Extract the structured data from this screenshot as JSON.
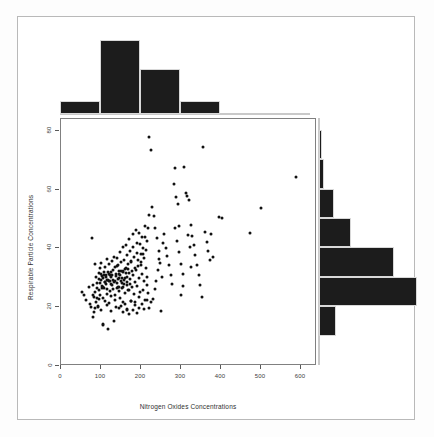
{
  "chart_data": {
    "type": "scatter",
    "title": "",
    "xlabel": "Nitrogen Oxides Concentrations",
    "ylabel": "Respirable Particle Concentrations",
    "xlim": [
      0,
      640
    ],
    "ylim": [
      0,
      84
    ],
    "xticks": [
      0,
      100,
      200,
      300,
      400,
      500,
      600
    ],
    "yticks": [
      0,
      20,
      40,
      60,
      80
    ],
    "grid": false,
    "legend": null,
    "marker_color": "#111111",
    "n_points": 260,
    "points": [
      [
        52,
        25.2
      ],
      [
        58,
        24.3
      ],
      [
        63,
        22.5
      ],
      [
        70,
        26.8
      ],
      [
        72,
        21.0
      ],
      [
        75,
        20.2
      ],
      [
        78,
        43.5
      ],
      [
        80,
        27.5
      ],
      [
        82,
        23.4
      ],
      [
        84,
        19.8
      ],
      [
        86,
        25.0
      ],
      [
        88,
        21.6
      ],
      [
        90,
        28.2
      ],
      [
        92,
        20.4
      ],
      [
        94,
        22.8
      ],
      [
        96,
        26.0
      ],
      [
        98,
        24.0
      ],
      [
        100,
        19.0
      ],
      [
        102,
        30.5
      ],
      [
        104,
        23.1
      ],
      [
        105,
        13.9
      ],
      [
        106,
        14.2
      ],
      [
        108,
        26.4
      ],
      [
        110,
        22.0
      ],
      [
        112,
        27.8
      ],
      [
        114,
        20.8
      ],
      [
        116,
        24.6
      ],
      [
        118,
        29.3
      ],
      [
        120,
        21.4
      ],
      [
        122,
        25.6
      ],
      [
        124,
        23.8
      ],
      [
        126,
        18.6
      ],
      [
        128,
        31.0
      ],
      [
        130,
        26.2
      ],
      [
        132,
        28.6
      ],
      [
        134,
        22.4
      ],
      [
        136,
        24.2
      ],
      [
        138,
        20.0
      ],
      [
        140,
        34.0
      ],
      [
        142,
        27.0
      ],
      [
        144,
        30.0
      ],
      [
        146,
        25.4
      ],
      [
        148,
        23.0
      ],
      [
        150,
        29.0
      ],
      [
        152,
        26.6
      ],
      [
        154,
        32.2
      ],
      [
        156,
        21.8
      ],
      [
        158,
        28.0
      ],
      [
        118,
        12.6
      ],
      [
        132,
        15.4
      ],
      [
        160,
        24.8
      ],
      [
        162,
        31.6
      ],
      [
        164,
        27.4
      ],
      [
        166,
        19.4
      ],
      [
        168,
        33.0
      ],
      [
        170,
        25.8
      ],
      [
        172,
        29.6
      ],
      [
        174,
        22.2
      ],
      [
        176,
        35.5
      ],
      [
        178,
        26.8
      ],
      [
        180,
        30.8
      ],
      [
        182,
        24.4
      ],
      [
        184,
        28.4
      ],
      [
        186,
        20.6
      ],
      [
        188,
        32.6
      ],
      [
        190,
        27.2
      ],
      [
        192,
        36.0
      ],
      [
        194,
        23.6
      ],
      [
        196,
        29.8
      ],
      [
        198,
        25.0
      ],
      [
        200,
        34.4
      ],
      [
        202,
        31.2
      ],
      [
        204,
        26.0
      ],
      [
        206,
        38.0
      ],
      [
        208,
        28.8
      ],
      [
        210,
        22.6
      ],
      [
        212,
        33.4
      ],
      [
        214,
        30.2
      ],
      [
        216,
        27.6
      ],
      [
        218,
        24.8
      ],
      [
        95,
        31.5
      ],
      [
        97,
        33.2
      ],
      [
        99,
        29.4
      ],
      [
        101,
        35.0
      ],
      [
        103,
        27.2
      ],
      [
        107,
        31.8
      ],
      [
        109,
        28.4
      ],
      [
        111,
        33.8
      ],
      [
        113,
        30.4
      ],
      [
        115,
        36.5
      ],
      [
        117,
        32.0
      ],
      [
        119,
        29.0
      ],
      [
        121,
        34.6
      ],
      [
        123,
        31.0
      ],
      [
        125,
        27.8
      ],
      [
        127,
        35.8
      ],
      [
        129,
        32.8
      ],
      [
        131,
        29.2
      ],
      [
        133,
        37.2
      ],
      [
        135,
        33.6
      ],
      [
        137,
        30.6
      ],
      [
        139,
        28.2
      ],
      [
        141,
        36.8
      ],
      [
        143,
        34.2
      ],
      [
        145,
        31.4
      ],
      [
        147,
        38.6
      ],
      [
        149,
        35.2
      ],
      [
        151,
        32.4
      ],
      [
        153,
        29.8
      ],
      [
        155,
        40.4
      ],
      [
        157,
        36.2
      ],
      [
        159,
        33.0
      ],
      [
        161,
        30.0
      ],
      [
        163,
        41.0
      ],
      [
        165,
        37.6
      ],
      [
        167,
        34.8
      ],
      [
        169,
        31.6
      ],
      [
        171,
        43.2
      ],
      [
        173,
        39.0
      ],
      [
        175,
        35.6
      ],
      [
        177,
        32.2
      ],
      [
        179,
        44.8
      ],
      [
        181,
        40.6
      ],
      [
        183,
        37.0
      ],
      [
        185,
        33.4
      ],
      [
        187,
        46.2
      ],
      [
        189,
        42.0
      ],
      [
        191,
        38.4
      ],
      [
        193,
        34.0
      ],
      [
        195,
        45.4
      ],
      [
        197,
        41.4
      ],
      [
        199,
        38.0
      ],
      [
        201,
        35.4
      ],
      [
        203,
        43.8
      ],
      [
        205,
        40.0
      ],
      [
        207,
        36.6
      ],
      [
        209,
        47.5
      ],
      [
        211,
        44.0
      ],
      [
        213,
        39.6
      ],
      [
        215,
        42.6
      ],
      [
        217,
        46.8
      ],
      [
        219,
        51.5
      ],
      [
        221,
        78.0
      ],
      [
        224,
        73.5
      ],
      [
        228,
        54.2
      ],
      [
        232,
        51.0
      ],
      [
        236,
        47.0
      ],
      [
        240,
        43.4
      ],
      [
        244,
        39.2
      ],
      [
        248,
        35.0
      ],
      [
        252,
        30.4
      ],
      [
        250,
        18.8
      ],
      [
        230,
        22.8
      ],
      [
        235,
        26.2
      ],
      [
        238,
        29.0
      ],
      [
        242,
        32.8
      ],
      [
        246,
        36.4
      ],
      [
        254,
        42.0
      ],
      [
        258,
        45.0
      ],
      [
        262,
        40.2
      ],
      [
        266,
        37.4
      ],
      [
        270,
        34.2
      ],
      [
        274,
        30.8
      ],
      [
        278,
        28.0
      ],
      [
        282,
        62.0
      ],
      [
        286,
        67.4
      ],
      [
        288,
        57.4
      ],
      [
        292,
        55.0
      ],
      [
        296,
        38.6
      ],
      [
        300,
        34.6
      ],
      [
        304,
        31.2
      ],
      [
        308,
        67.6
      ],
      [
        312,
        59.0
      ],
      [
        316,
        57.8
      ],
      [
        320,
        56.6
      ],
      [
        324,
        48.0
      ],
      [
        328,
        44.2
      ],
      [
        332,
        41.0
      ],
      [
        336,
        37.8
      ],
      [
        340,
        34.4
      ],
      [
        344,
        31.0
      ],
      [
        348,
        27.6
      ],
      [
        352,
        23.4
      ],
      [
        356,
        74.5
      ],
      [
        360,
        45.6
      ],
      [
        364,
        42.2
      ],
      [
        368,
        39.0
      ],
      [
        372,
        36.0
      ],
      [
        376,
        44.8
      ],
      [
        380,
        37.2
      ],
      [
        396,
        50.6
      ],
      [
        402,
        50.4
      ],
      [
        472,
        45.2
      ],
      [
        500,
        53.8
      ],
      [
        588,
        64.4
      ],
      [
        85,
        34.6
      ],
      [
        87,
        30.2
      ],
      [
        89,
        26.6
      ],
      [
        91,
        23.2
      ],
      [
        93,
        20.2
      ],
      [
        83,
        18.4
      ],
      [
        81,
        16.8
      ],
      [
        79,
        24.0
      ],
      [
        145,
        19.6
      ],
      [
        150,
        20.4
      ],
      [
        155,
        18.2
      ],
      [
        160,
        21.2
      ],
      [
        165,
        19.0
      ],
      [
        170,
        17.8
      ],
      [
        175,
        22.0
      ],
      [
        180,
        19.2
      ],
      [
        185,
        21.6
      ],
      [
        190,
        18.0
      ],
      [
        196,
        19.8
      ],
      [
        203,
        21.0
      ],
      [
        208,
        19.4
      ],
      [
        214,
        22.4
      ],
      [
        220,
        19.6
      ],
      [
        226,
        21.8
      ],
      [
        136,
        28.8
      ],
      [
        138,
        31.2
      ],
      [
        140,
        26.4
      ],
      [
        142,
        29.6
      ],
      [
        144,
        32.4
      ],
      [
        146,
        27.0
      ],
      [
        148,
        30.8
      ],
      [
        152,
        28.2
      ],
      [
        154,
        31.8
      ],
      [
        156,
        26.8
      ],
      [
        158,
        29.4
      ],
      [
        162,
        33.2
      ],
      [
        164,
        28.6
      ],
      [
        166,
        30.2
      ],
      [
        168,
        26.0
      ],
      [
        172,
        28.0
      ],
      [
        126,
        30.2
      ],
      [
        128,
        27.4
      ],
      [
        124,
        32.0
      ],
      [
        122,
        28.8
      ],
      [
        120,
        31.4
      ],
      [
        116,
        29.2
      ],
      [
        114,
        26.2
      ],
      [
        112,
        31.0
      ],
      [
        110,
        28.4
      ],
      [
        108,
        30.8
      ],
      [
        106,
        27.0
      ],
      [
        104,
        29.8
      ],
      [
        102,
        26.4
      ],
      [
        100,
        31.2
      ],
      [
        98,
        28.2
      ],
      [
        96,
        29.6
      ],
      [
        300,
        24.0
      ],
      [
        304,
        27.2
      ],
      [
        286,
        46.8
      ],
      [
        290,
        42.4
      ],
      [
        294,
        47.6
      ],
      [
        318,
        44.6
      ],
      [
        322,
        40.4
      ],
      [
        326,
        33.8
      ]
    ]
  },
  "hist_top": {
    "type": "bar",
    "orientation": "vertical",
    "bin_width": 100,
    "bins": [
      {
        "range": "0-100",
        "start": 0,
        "end": 100,
        "count": 13
      },
      {
        "range": "100-200",
        "start": 100,
        "end": 200,
        "count": 72
      },
      {
        "range": "200-300",
        "start": 200,
        "end": 300,
        "count": 44
      },
      {
        "range": "300-400",
        "start": 300,
        "end": 400,
        "count": 13
      }
    ],
    "max_count": 72
  },
  "hist_right": {
    "type": "bar",
    "orientation": "horizontal",
    "bin_width": 10,
    "bins": [
      {
        "range": "70-80",
        "start": 70,
        "end": 80,
        "count": 2
      },
      {
        "range": "60-70",
        "start": 60,
        "end": 70,
        "count": 4
      },
      {
        "range": "50-60",
        "start": 50,
        "end": 60,
        "count": 11
      },
      {
        "range": "40-50",
        "start": 40,
        "end": 50,
        "count": 24
      },
      {
        "range": "30-40",
        "start": 30,
        "end": 40,
        "count": 57
      },
      {
        "range": "20-30",
        "start": 20,
        "end": 30,
        "count": 74
      },
      {
        "range": "10-20",
        "start": 10,
        "end": 20,
        "count": 13
      }
    ],
    "max_count": 74
  }
}
